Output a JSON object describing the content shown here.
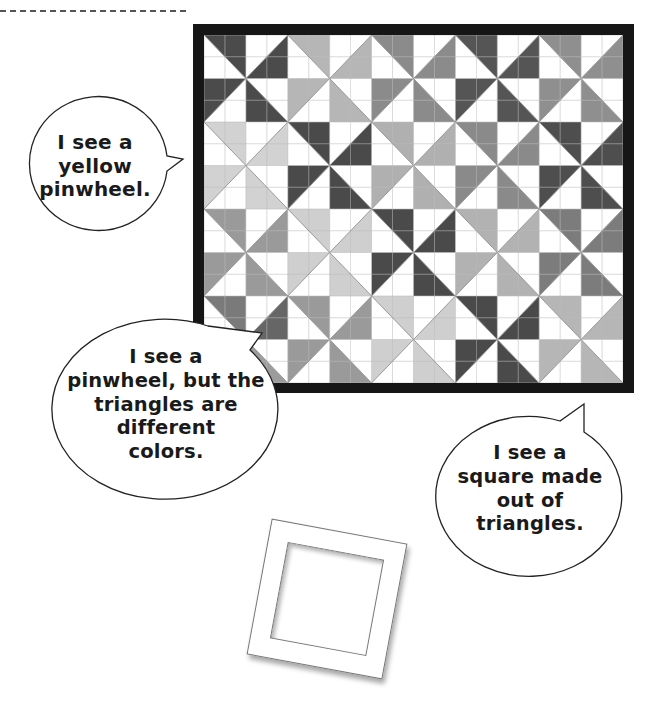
{
  "figure": {
    "quilt": {
      "pinwheel_rows": 4,
      "pinwheel_cols": 5,
      "block_pattern": "pinwheel of four half-square triangles (each pinwheel is 2x2 blocks)",
      "border_color": "#161616",
      "grid_line_color": "#bdbdbd",
      "pinwheel_colors": [
        [
          "#4b4b4b",
          "#b6b6b6",
          "#8b8b8b",
          "#555555",
          "#8f8f8f"
        ],
        [
          "#d2d2d2",
          "#4a4a4a",
          "#b0b0b0",
          "#8a8a8a",
          "#4e4e4e"
        ],
        [
          "#9a9a9a",
          "#cfcfcf",
          "#4a4a4a",
          "#b2b2b2",
          "#7c7c7c"
        ],
        [
          [
            "#7a7a7a",
            "#666666",
            "#8a8a8a",
            "#9c9c9c"
          ],
          "#9a9a9a",
          "#cfcfcf",
          "#4a4a4a",
          "#b6b6b6"
        ]
      ]
    },
    "bubbles": [
      {
        "lines": [
          "I see a",
          "yellow",
          "pinwheel."
        ]
      },
      {
        "lines": [
          "I see a",
          "pinwheel, but the",
          "triangles are",
          "different",
          "colors."
        ]
      },
      {
        "lines": [
          "I see a",
          "square made",
          "out of",
          "triangles."
        ]
      }
    ],
    "photo_frame": {
      "description": "empty tilted square frame"
    }
  }
}
